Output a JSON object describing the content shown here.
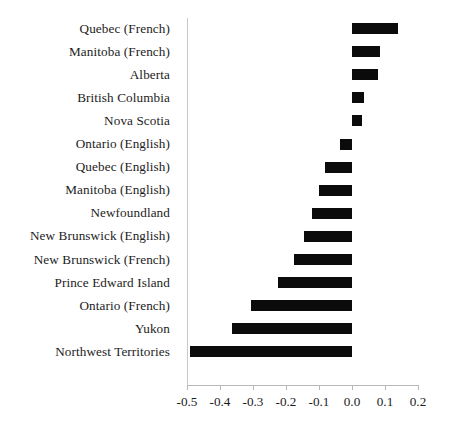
{
  "chart_data": {
    "type": "bar",
    "orientation": "horizontal",
    "title": "",
    "subtitle": "",
    "xlabel": "",
    "ylabel": "",
    "xlim": [
      -0.5,
      0.2
    ],
    "grid": false,
    "legend": null,
    "zero_reference_line": true,
    "bar_color": "#0b0b0b",
    "axis_color": "#b9b9b9",
    "xticks": [
      -0.5,
      -0.4,
      -0.3,
      -0.2,
      -0.1,
      0.0,
      0.1,
      0.2
    ],
    "xtick_labels": [
      "-0.5",
      "-0.4",
      "-0.3",
      "-0.2",
      "-0.1",
      "0.0",
      "0.1",
      "0.2"
    ],
    "categories": [
      "Quebec (French)",
      "Manitoba (French)",
      "Alberta",
      "British Columbia",
      "Nova Scotia",
      "Ontario (English)",
      "Quebec (English)",
      "Manitoba (English)",
      "Newfoundland",
      "New Brunswick (English)",
      "New Brunswick (French)",
      "Prince Edward Island",
      "Ontario (French)",
      "Yukon",
      "Northwest Territories"
    ],
    "values": [
      0.139,
      0.085,
      0.078,
      0.036,
      0.03,
      -0.036,
      -0.082,
      -0.1,
      -0.122,
      -0.145,
      -0.175,
      -0.225,
      -0.305,
      -0.365,
      -0.49
    ]
  }
}
